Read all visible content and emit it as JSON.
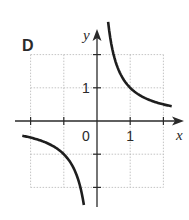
{
  "panel_label": "D",
  "chart_data": {
    "type": "line",
    "title": "",
    "function": "y = 1/x",
    "xlabel": "x",
    "ylabel": "y",
    "xlim": [
      -2,
      2
    ],
    "ylim": [
      -2,
      2
    ],
    "grid": true,
    "origin_label": "0",
    "x_tick_labels": [
      {
        "value": 1,
        "label": "1"
      }
    ],
    "y_tick_labels": [
      {
        "value": 1,
        "label": "1"
      }
    ],
    "series": [
      {
        "name": "branch-positive",
        "x": [
          0.35,
          0.5,
          0.75,
          1,
          1.5,
          2.2
        ],
        "y": [
          2.85,
          2,
          1.33,
          1,
          0.67,
          0.45
        ]
      },
      {
        "name": "branch-negative",
        "x": [
          -2.25,
          -1.5,
          -1,
          -0.75,
          -0.5,
          -0.4
        ],
        "y": [
          -0.44,
          -0.67,
          -1,
          -1.33,
          -2,
          -2.5
        ]
      }
    ]
  },
  "colors": {
    "curve": "#1e1e1e",
    "axis": "#2a2a2a",
    "grid": "#b5b5b5",
    "text": "#2a2a2a"
  }
}
